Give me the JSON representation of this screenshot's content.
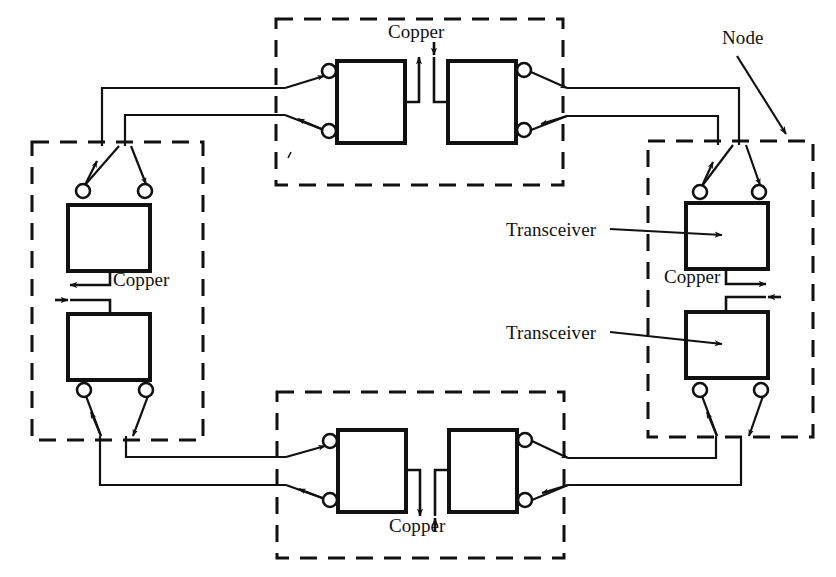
{
  "figure": {
    "type": "network-topology-diagram",
    "background_color": "#ffffff",
    "line_color": "#111111",
    "canvas": {
      "width": 836,
      "height": 577
    }
  },
  "labels": {
    "node": "Node",
    "transceiver_upper": "Transceiver",
    "transceiver_lower": "Transceiver",
    "copper_top": "Copper",
    "copper_left": "Copper",
    "copper_right": "Copper",
    "copper_bottom": "Copper"
  },
  "nodes": [
    {
      "id": "node-top",
      "name": "Top node",
      "orientation": "horizontal",
      "boundary": {
        "x": 276,
        "y": 19,
        "width": 287,
        "height": 166
      },
      "transceivers": [
        {
          "id": "top-left-transceiver",
          "box": {
            "x": 337,
            "y": 61,
            "width": 68,
            "height": 82
          },
          "ports": 2
        },
        {
          "id": "top-right-transceiver",
          "box": {
            "x": 448,
            "y": 61,
            "width": 68,
            "height": 82
          },
          "ports": 2
        }
      ],
      "copper_link": {
        "label": "Copper",
        "label_x": 388,
        "label_y": 30
      }
    },
    {
      "id": "node-right",
      "name": "Right node",
      "orientation": "vertical",
      "boundary": {
        "x": 648,
        "y": 141,
        "width": 165,
        "height": 296
      },
      "transceivers": [
        {
          "id": "right-upper-transceiver",
          "box": {
            "x": 686,
            "y": 203,
            "width": 82,
            "height": 66
          },
          "ports": 2
        },
        {
          "id": "right-lower-transceiver",
          "box": {
            "x": 686,
            "y": 312,
            "width": 82,
            "height": 66
          },
          "ports": 2
        }
      ],
      "copper_link": {
        "label": "Copper",
        "label_x": 668,
        "label_y": 273
      }
    },
    {
      "id": "node-bottom",
      "name": "Bottom node",
      "orientation": "horizontal",
      "boundary": {
        "x": 277,
        "y": 392,
        "width": 287,
        "height": 166
      },
      "transceivers": [
        {
          "id": "bottom-left-transceiver",
          "box": {
            "x": 338,
            "y": 430,
            "width": 68,
            "height": 82
          },
          "ports": 2
        },
        {
          "id": "bottom-right-transceiver",
          "box": {
            "x": 449,
            "y": 430,
            "width": 68,
            "height": 82
          },
          "ports": 2
        }
      ],
      "copper_link": {
        "label": "Copper",
        "label_x": 389,
        "label_y": 523
      }
    },
    {
      "id": "node-left",
      "name": "Left node",
      "orientation": "vertical",
      "boundary": {
        "x": 32,
        "y": 142,
        "width": 171,
        "height": 298
      },
      "transceivers": [
        {
          "id": "left-upper-transceiver",
          "box": {
            "x": 68,
            "y": 205,
            "width": 82,
            "height": 66
          },
          "ports": 2
        },
        {
          "id": "left-lower-transceiver",
          "box": {
            "x": 68,
            "y": 314,
            "width": 82,
            "height": 66
          },
          "ports": 2
        }
      ],
      "copper_link": {
        "label": "Copper",
        "label_x": 115,
        "label_y": 276
      }
    }
  ],
  "callouts": [
    {
      "id": "node-callout",
      "text": "Node",
      "text_x": 726,
      "text_y": 40,
      "arrow_from": [
        735,
        60
      ],
      "arrow_to": [
        784,
        135
      ]
    },
    {
      "id": "transceiver-callout-upper",
      "text": "Transceiver",
      "text_x": 508,
      "text_y": 230,
      "arrow_from": [
        612,
        231
      ],
      "arrow_to": [
        723,
        235
      ]
    },
    {
      "id": "transceiver-callout-lower",
      "text": "Transceiver",
      "text_x": 508,
      "text_y": 327,
      "arrow_from": [
        612,
        334
      ],
      "arrow_to": [
        723,
        344
      ]
    }
  ],
  "links": [
    {
      "id": "link-top-left",
      "from": "node-top",
      "to": "node-left",
      "pairs": 2
    },
    {
      "id": "link-top-right",
      "from": "node-top",
      "to": "node-right",
      "pairs": 2
    },
    {
      "id": "link-bottom-left",
      "from": "node-bottom",
      "to": "node-left",
      "pairs": 2
    },
    {
      "id": "link-bottom-right",
      "from": "node-bottom",
      "to": "node-right",
      "pairs": 2
    }
  ]
}
